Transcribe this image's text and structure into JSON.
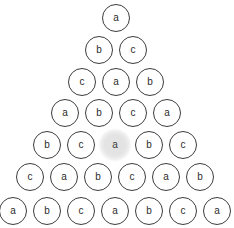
{
  "figure": {
    "name": "letter-pyramid",
    "background_color": "#ffffff",
    "node_stroke_color": "#3c3c3c",
    "node_label_color": "#2b2b2b",
    "highlight_fill_color": "#e2e2e2",
    "node_diameter": 28,
    "horizontal_spacing": 34,
    "vertical_spacing": 32
  },
  "chart_data": {
    "type": "diagram",
    "title": "",
    "rows": [
      {
        "index": 0,
        "labels": [
          "a"
        ]
      },
      {
        "index": 1,
        "labels": [
          "b",
          "c"
        ]
      },
      {
        "index": 2,
        "labels": [
          "c",
          "a",
          "b"
        ]
      },
      {
        "index": 3,
        "labels": [
          "a",
          "b",
          "c",
          "a"
        ]
      },
      {
        "index": 4,
        "labels": [
          "b",
          "c",
          "a",
          "b",
          "c"
        ]
      },
      {
        "index": 5,
        "labels": [
          "c",
          "a",
          "b",
          "c",
          "a",
          "b"
        ]
      },
      {
        "index": 6,
        "labels": [
          "a",
          "b",
          "c",
          "a",
          "b",
          "c",
          "a"
        ]
      }
    ],
    "highlighted": {
      "row": 4,
      "position": 2,
      "label": "a"
    }
  },
  "nodes": [
    {
      "id": "r0c0",
      "label": "a",
      "row": 0,
      "col": 0,
      "cx": 116,
      "cy": 18,
      "highlight": false
    },
    {
      "id": "r1c0",
      "label": "b",
      "row": 1,
      "col": 0,
      "cx": 99,
      "cy": 50,
      "highlight": false
    },
    {
      "id": "r1c1",
      "label": "c",
      "row": 1,
      "col": 1,
      "cx": 133,
      "cy": 50,
      "highlight": false
    },
    {
      "id": "r2c0",
      "label": "c",
      "row": 2,
      "col": 0,
      "cx": 82,
      "cy": 82,
      "highlight": false
    },
    {
      "id": "r2c1",
      "label": "a",
      "row": 2,
      "col": 1,
      "cx": 116,
      "cy": 82,
      "highlight": false
    },
    {
      "id": "r2c2",
      "label": "b",
      "row": 2,
      "col": 2,
      "cx": 150,
      "cy": 82,
      "highlight": false
    },
    {
      "id": "r3c0",
      "label": "a",
      "row": 3,
      "col": 0,
      "cx": 65,
      "cy": 113,
      "highlight": false
    },
    {
      "id": "r3c1",
      "label": "b",
      "row": 3,
      "col": 1,
      "cx": 99,
      "cy": 113,
      "highlight": false
    },
    {
      "id": "r3c2",
      "label": "c",
      "row": 3,
      "col": 2,
      "cx": 133,
      "cy": 113,
      "highlight": false
    },
    {
      "id": "r3c3",
      "label": "a",
      "row": 3,
      "col": 3,
      "cx": 167,
      "cy": 113,
      "highlight": false
    },
    {
      "id": "r4c0",
      "label": "b",
      "row": 4,
      "col": 0,
      "cx": 47,
      "cy": 145,
      "highlight": false
    },
    {
      "id": "r4c1",
      "label": "c",
      "row": 4,
      "col": 1,
      "cx": 81,
      "cy": 145,
      "highlight": false
    },
    {
      "id": "r4c2",
      "label": "a",
      "row": 4,
      "col": 2,
      "cx": 115,
      "cy": 145,
      "highlight": true
    },
    {
      "id": "r4c3",
      "label": "b",
      "row": 4,
      "col": 3,
      "cx": 149,
      "cy": 145,
      "highlight": false
    },
    {
      "id": "r4c4",
      "label": "c",
      "row": 4,
      "col": 4,
      "cx": 183,
      "cy": 145,
      "highlight": false
    },
    {
      "id": "r5c0",
      "label": "c",
      "row": 5,
      "col": 0,
      "cx": 30,
      "cy": 177,
      "highlight": false
    },
    {
      "id": "r5c1",
      "label": "a",
      "row": 5,
      "col": 1,
      "cx": 64,
      "cy": 177,
      "highlight": false
    },
    {
      "id": "r5c2",
      "label": "b",
      "row": 5,
      "col": 2,
      "cx": 98,
      "cy": 177,
      "highlight": false
    },
    {
      "id": "r5c3",
      "label": "c",
      "row": 5,
      "col": 3,
      "cx": 132,
      "cy": 177,
      "highlight": false
    },
    {
      "id": "r5c4",
      "label": "a",
      "row": 5,
      "col": 4,
      "cx": 166,
      "cy": 177,
      "highlight": false
    },
    {
      "id": "r5c5",
      "label": "b",
      "row": 5,
      "col": 5,
      "cx": 200,
      "cy": 177,
      "highlight": false
    },
    {
      "id": "r6c0",
      "label": "a",
      "row": 6,
      "col": 0,
      "cx": 13,
      "cy": 211,
      "highlight": false
    },
    {
      "id": "r6c1",
      "label": "b",
      "row": 6,
      "col": 1,
      "cx": 47,
      "cy": 211,
      "highlight": false
    },
    {
      "id": "r6c2",
      "label": "c",
      "row": 6,
      "col": 2,
      "cx": 81,
      "cy": 211,
      "highlight": false
    },
    {
      "id": "r6c3",
      "label": "a",
      "row": 6,
      "col": 3,
      "cx": 115,
      "cy": 211,
      "highlight": false
    },
    {
      "id": "r6c4",
      "label": "b",
      "row": 6,
      "col": 4,
      "cx": 149,
      "cy": 211,
      "highlight": false
    },
    {
      "id": "r6c5",
      "label": "c",
      "row": 6,
      "col": 5,
      "cx": 183,
      "cy": 211,
      "highlight": false
    },
    {
      "id": "r6c6",
      "label": "a",
      "row": 6,
      "col": 6,
      "cx": 217,
      "cy": 211,
      "highlight": false
    }
  ]
}
